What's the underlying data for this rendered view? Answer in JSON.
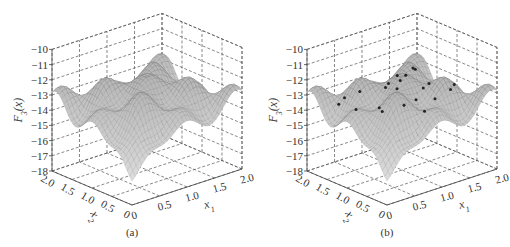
{
  "chart_data": [
    {
      "type": "surface3d",
      "panel_label": "(a)",
      "zlabel": "F3(x)",
      "zlabel_main": "F",
      "zlabel_sub": "3",
      "zlabel_arg": "(x)",
      "xlabel_main": "x",
      "xlabel_sub": "1",
      "ylabel_main": "x",
      "ylabel_sub": "2",
      "xlim": [
        0,
        2.0
      ],
      "ylim": [
        0,
        2.0
      ],
      "zlim": [
        -18,
        -10
      ],
      "x_ticks": [
        "0",
        "0.5",
        "1.0",
        "1.5",
        "2.0"
      ],
      "y_ticks": [
        "0",
        "0.5",
        "1.0",
        "1.5",
        "2.0"
      ],
      "z_ticks": [
        "-10",
        "-11",
        "-12",
        "-13",
        "-14",
        "-15",
        "-16",
        "-17",
        "-18"
      ],
      "grid": true,
      "points": []
    },
    {
      "type": "surface3d",
      "panel_label": "(b)",
      "zlabel": "F3(x)",
      "zlabel_main": "F",
      "zlabel_sub": "3",
      "zlabel_arg": "(x)",
      "xlabel_main": "x",
      "xlabel_sub": "1",
      "ylabel_main": "x",
      "ylabel_sub": "2",
      "xlim": [
        0,
        2.0
      ],
      "ylim": [
        0,
        2.0
      ],
      "zlim": [
        -18,
        -10
      ],
      "x_ticks": [
        "0",
        "0.5",
        "1.0",
        "1.5",
        "2.0"
      ],
      "y_ticks": [
        "0",
        "0.5",
        "1.0",
        "1.5",
        "2.0"
      ],
      "z_ticks": [
        "-10",
        "-11",
        "-12",
        "-13",
        "-14",
        "-15",
        "-16",
        "-17",
        "-18"
      ],
      "grid": true,
      "points": [
        [
          1.75,
          1.7
        ],
        [
          1.55,
          1.8
        ],
        [
          1.6,
          1.55
        ],
        [
          1.3,
          1.75
        ],
        [
          1.1,
          1.55
        ],
        [
          1.25,
          1.25
        ],
        [
          0.95,
          1.05
        ],
        [
          1.35,
          0.95
        ],
        [
          1.0,
          0.65
        ],
        [
          0.8,
          0.85
        ],
        [
          0.55,
          0.95
        ],
        [
          0.45,
          1.3
        ],
        [
          0.25,
          1.55
        ],
        [
          0.35,
          0.6
        ],
        [
          0.2,
          1.05
        ],
        [
          0.6,
          0.4
        ],
        [
          1.6,
          1.15
        ],
        [
          1.7,
          0.75
        ],
        [
          1.55,
          0.45
        ],
        [
          0.9,
          0.3
        ],
        [
          0.5,
          1.75
        ],
        [
          1.2,
          0.45
        ]
      ]
    }
  ]
}
